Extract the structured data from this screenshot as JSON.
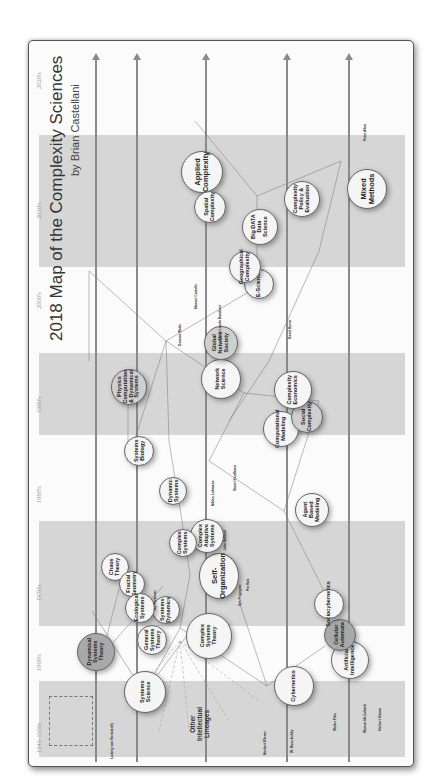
{
  "diagram": {
    "title": "2018 Map of the Complexity Sciences",
    "author": "by Brian Castellani",
    "orientation": "rotated 90deg counter-clockwise",
    "decades": [
      "1940-1950s",
      "1960's",
      "1970's",
      "1980's",
      "1990's",
      "2000's",
      "2010's",
      "2020's"
    ],
    "other_lineages_label": "Other\nIntellectual\nLineages",
    "nodes": [
      {
        "label": "Complexity\nSciences\nEarly",
        "style": "light"
      },
      {
        "label": "Systems\nScience",
        "style": "light"
      },
      {
        "label": "Dynamical\nSystems\nTheory",
        "style": "dark"
      },
      {
        "label": "Cybernetics",
        "style": "light"
      },
      {
        "label": "Artificial\nIntelligence",
        "style": "light"
      },
      {
        "label": "Cellular\nAutomata",
        "style": "dark"
      },
      {
        "label": "Complex\nSystems\nTheory",
        "style": "light"
      },
      {
        "label": "Self-\nOrganization",
        "style": "light"
      },
      {
        "label": "Complex\nAdaptive\nSystems",
        "style": "light"
      },
      {
        "label": "Network\nScience",
        "style": "light"
      },
      {
        "label": "Physics\nComputation\n& Dynamical\nSystems",
        "style": "mid"
      },
      {
        "label": "Agent Based\nModeling",
        "style": "light"
      },
      {
        "label": "Computational\nModeling",
        "style": "light"
      },
      {
        "label": "Social\nComplexity",
        "style": "light"
      },
      {
        "label": "Complexity\nEconomics",
        "style": "light"
      },
      {
        "label": "Global\nNetwork\nSociety",
        "style": "light"
      },
      {
        "label": "Big DATA\nData Science",
        "style": "light"
      },
      {
        "label": "E-Science",
        "style": "light"
      },
      {
        "label": "Complexity\nPolicy &\nEvaluation",
        "style": "light"
      },
      {
        "label": "Applied\nComplexity",
        "style": "light"
      },
      {
        "label": "Mixed\nMethods",
        "style": "light"
      },
      {
        "label": "Spatial\nComplexity",
        "style": "light"
      },
      {
        "label": "Geographical\nComplexity",
        "style": "light"
      },
      {
        "label": "Chaos\nTheory",
        "style": "light"
      },
      {
        "label": "Fractal\nGeometry",
        "style": "light"
      },
      {
        "label": "General\nSystems\nTheory",
        "style": "light"
      },
      {
        "label": "Systems\nDynamics",
        "style": "light"
      },
      {
        "label": "Ecological\nSystems",
        "style": "light"
      },
      {
        "label": "Dynamic\nSystems",
        "style": "light"
      },
      {
        "label": "Sociocybernetics",
        "style": "light"
      },
      {
        "label": "Systems\nBiology",
        "style": "light"
      },
      {
        "label": "Complex\nSystems",
        "style": "light"
      }
    ],
    "people": [
      "Ludwig von Bertalanffy",
      "Norbert Wiener",
      "W. Ross Ashby",
      "Walter Pitts",
      "Warren McCulloch",
      "Herbert Simon",
      "Alan Turing",
      "John von Neumann",
      "Ilya Prigogine",
      "Stephen Wolfram",
      "John Holland",
      "Duncan Watts",
      "Albert-Laszlo Barabasi",
      "Manuel Castells",
      "Peter Allen",
      "Brian Castellani",
      "David Byrne",
      "Jay Forrester",
      "Edgar Morin",
      "Niklas Luhmann",
      "Stuart Kauffman",
      "Robert Axelrod",
      "Per Bak",
      "Benoit Mandelbrot",
      "Edward Lorenz",
      "Gregory Bateson",
      "Kenneth Boulding"
    ]
  }
}
